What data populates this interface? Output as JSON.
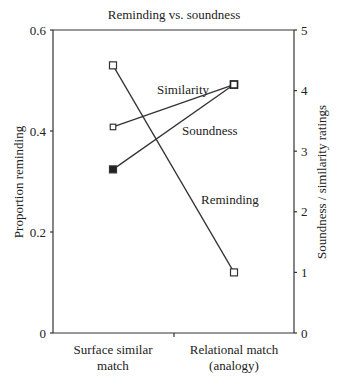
{
  "chart_data": {
    "type": "line",
    "title": "Reminding vs. soundness",
    "categories": [
      "Surface similar match",
      "Relational match (analogy)"
    ],
    "category_lines": [
      [
        "Surface similar",
        "match"
      ],
      [
        "Relational match",
        "(analogy)"
      ]
    ],
    "xlabel": "",
    "ylabel": "Proportion reminding",
    "ylabel_right": "Soundness / similarity ratings",
    "ylim": [
      0,
      0.6
    ],
    "ylim_right": [
      0,
      5
    ],
    "yticks": [
      "0",
      "0.2",
      "0.4",
      "0.6"
    ],
    "yticks_right": [
      "0",
      "1",
      "2",
      "3",
      "4",
      "5"
    ],
    "grid": false,
    "legend": "inline labels",
    "series": [
      {
        "name": "Reminding",
        "axis": "left",
        "values": [
          0.53,
          0.12
        ],
        "marker": "open-square",
        "label_pos": [
          201,
          204
        ]
      },
      {
        "name": "Similarity",
        "axis": "right",
        "values": [
          3.4,
          4.1
        ],
        "marker": "open-square-small",
        "label_pos": [
          157,
          94
        ]
      },
      {
        "name": "Soundness",
        "axis": "right",
        "values": [
          2.7,
          4.1
        ],
        "marker": "filled-square",
        "label_pos": [
          182,
          135
        ]
      }
    ]
  }
}
